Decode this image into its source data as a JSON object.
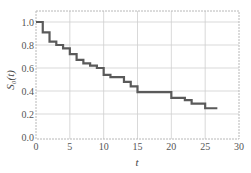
{
  "chart_data": {
    "type": "line",
    "subtype": "step",
    "title": "",
    "xlabel": "t",
    "ylabel": "S_0(t)",
    "ylabel_display": "S₀(t)",
    "xlim": [
      0,
      30
    ],
    "ylim": [
      0,
      1.08
    ],
    "xticks": [
      0,
      5,
      10,
      15,
      20,
      25,
      30
    ],
    "yticks": [
      0.0,
      0.2,
      0.4,
      0.6,
      0.8,
      1.0
    ],
    "xtick_labels": [
      "0",
      "5",
      "10",
      "15",
      "20",
      "25",
      "30"
    ],
    "ytick_labels": [
      "0.0",
      "0.2",
      "0.4",
      "0.6",
      "0.8",
      "1.0"
    ],
    "grid": true,
    "legend": null,
    "series": [
      {
        "name": "S0(t)",
        "color": "#5a5a5a",
        "step_where": "post",
        "x": [
          0,
          1,
          2,
          3,
          4,
          5,
          6,
          7,
          8,
          9,
          10,
          11,
          13,
          14,
          15,
          20,
          22,
          23,
          25,
          26.8
        ],
        "y": [
          1.0,
          0.91,
          0.83,
          0.8,
          0.77,
          0.72,
          0.67,
          0.64,
          0.62,
          0.6,
          0.54,
          0.52,
          0.48,
          0.44,
          0.39,
          0.34,
          0.32,
          0.29,
          0.25,
          0.25
        ]
      }
    ]
  }
}
